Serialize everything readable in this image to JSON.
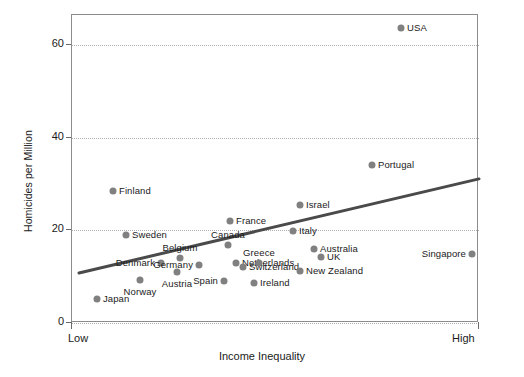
{
  "chart_data": {
    "type": "scatter",
    "title": "",
    "xlabel": "Income Inequality",
    "ylabel": "Homicides per Million",
    "x_axis": {
      "low_label": "Low",
      "high_label": "High",
      "qualitative": true
    },
    "y_axis": {
      "ticks": [
        0,
        20,
        40,
        60
      ],
      "tick_labels": [
        "0",
        "20",
        "40",
        "60"
      ],
      "ylim": [
        0,
        66.5
      ]
    },
    "grid": "horizontal-dotted",
    "legend": "none",
    "marker_color": "#808080",
    "trendline_color": "#4a4a4a",
    "trendline": {
      "x_start_px": 78,
      "y_start_value": 10.8,
      "x_end_px": 478,
      "y_end_value": 31.1
    },
    "points": [
      {
        "label": "Japan",
        "x_px": 96,
        "value": 5.2,
        "label_pos": "right"
      },
      {
        "label": "Finland",
        "x_px": 112,
        "value": 28.5,
        "label_pos": "right"
      },
      {
        "label": "Sweden",
        "x_px": 125,
        "value": 19.0,
        "label_pos": "right"
      },
      {
        "label": "Norway",
        "x_px": 139,
        "value": 9.2,
        "label_pos": "below"
      },
      {
        "label": "Denmark",
        "x_px": 160,
        "value": 13.0,
        "label_pos": "left"
      },
      {
        "label": "Belgium",
        "x_px": 179,
        "value": 14.0,
        "label_pos": "above"
      },
      {
        "label": "Austria",
        "x_px": 176,
        "value": 11.0,
        "label_pos": "below"
      },
      {
        "label": "Germany",
        "x_px": 198,
        "value": 12.6,
        "label_pos": "left"
      },
      {
        "label": "Spain",
        "x_px": 223,
        "value": 9.0,
        "label_pos": "left"
      },
      {
        "label": "Canada",
        "x_px": 227,
        "value": 16.8,
        "label_pos": "above"
      },
      {
        "label": "Netherlands",
        "x_px": 235,
        "value": 13.0,
        "label_pos": "right"
      },
      {
        "label": "France",
        "x_px": 229,
        "value": 22.0,
        "label_pos": "right"
      },
      {
        "label": "Switzerland",
        "x_px": 242,
        "value": 12.0,
        "label_pos": "right"
      },
      {
        "label": "Ireland",
        "x_px": 253,
        "value": 8.6,
        "label_pos": "right"
      },
      {
        "label": "Greece",
        "x_px": 258,
        "value": 13.0,
        "label_pos": "above"
      },
      {
        "label": "Italy",
        "x_px": 292,
        "value": 19.8,
        "label_pos": "right"
      },
      {
        "label": "Israel",
        "x_px": 299,
        "value": 25.5,
        "label_pos": "right"
      },
      {
        "label": "New Zealand",
        "x_px": 299,
        "value": 11.2,
        "label_pos": "right"
      },
      {
        "label": "Australia",
        "x_px": 313,
        "value": 16.0,
        "label_pos": "right"
      },
      {
        "label": "UK",
        "x_px": 320,
        "value": 14.2,
        "label_pos": "right"
      },
      {
        "label": "Portugal",
        "x_px": 371,
        "value": 34.0,
        "label_pos": "right"
      },
      {
        "label": "USA",
        "x_px": 400,
        "value": 63.7,
        "label_pos": "right"
      },
      {
        "label": "Singapore",
        "x_px": 471,
        "value": 14.8,
        "label_pos": "left"
      }
    ]
  }
}
